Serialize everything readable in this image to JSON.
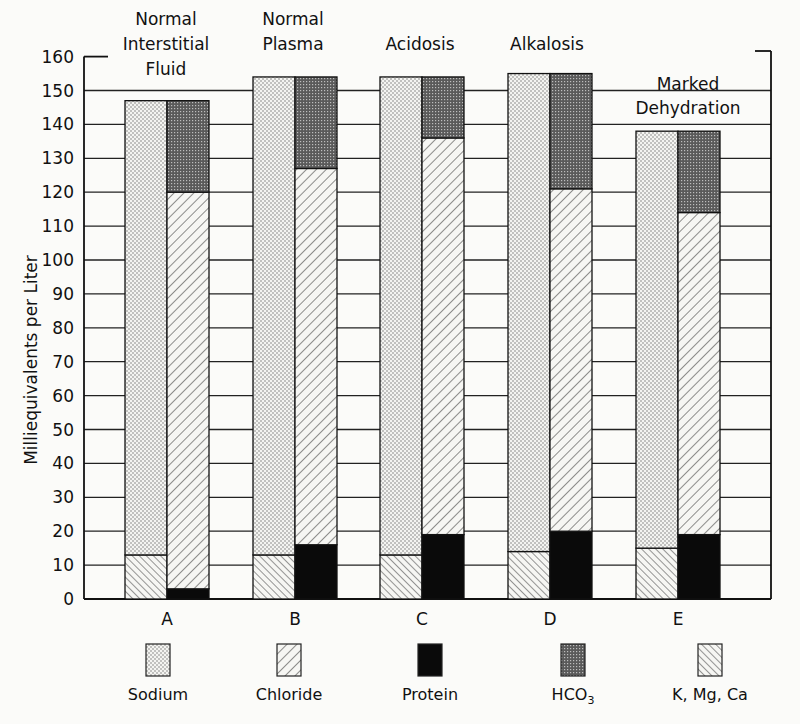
{
  "chart_data": {
    "type": "bar",
    "stacked": true,
    "title": "",
    "ylabel": "Milliequivalents per Liter",
    "xlabel": "",
    "ylim": [
      0,
      160
    ],
    "yticks": [
      0,
      10,
      20,
      30,
      40,
      50,
      60,
      70,
      80,
      90,
      100,
      110,
      120,
      130,
      140,
      150,
      160
    ],
    "grid": "horizontal",
    "categories": [
      "A",
      "B",
      "C",
      "D",
      "E"
    ],
    "category_titles": [
      [
        "Normal",
        "Interstitial",
        "Fluid"
      ],
      [
        "Normal",
        "Plasma"
      ],
      [
        "Acidosis"
      ],
      [
        "Alkalosis"
      ],
      [
        "Marked",
        "Dehydration"
      ]
    ],
    "bars_per_category": [
      "Cations",
      "Anions"
    ],
    "series": [
      {
        "name": "K, Mg, Ca",
        "stack": "Cations",
        "pattern": "back-hatch",
        "values": [
          13,
          13,
          13,
          14,
          15
        ]
      },
      {
        "name": "Sodium",
        "stack": "Cations",
        "pattern": "dots",
        "values": [
          134,
          141,
          141,
          141,
          123
        ]
      },
      {
        "name": "Protein",
        "stack": "Anions",
        "pattern": "solid-black",
        "values": [
          3,
          16,
          19,
          20,
          19
        ]
      },
      {
        "name": "Chloride",
        "stack": "Anions",
        "pattern": "forward-hatch",
        "values": [
          117,
          111,
          117,
          101,
          95
        ]
      },
      {
        "name": "HCO3",
        "stack": "Anions",
        "pattern": "dark-crosshatch",
        "values": [
          27,
          27,
          18,
          34,
          24
        ]
      }
    ],
    "totals": [
      147,
      154,
      154,
      155,
      138
    ],
    "legend": [
      "Sodium",
      "Chloride",
      "Protein",
      "HCO3",
      "K, Mg, Ca"
    ],
    "legend_position": "bottom"
  },
  "axis": {
    "ylabel": "Milliequivalents per Liter",
    "ticks": [
      "0",
      "10",
      "20",
      "30",
      "40",
      "50",
      "60",
      "70",
      "80",
      "90",
      "100",
      "110",
      "120",
      "130",
      "140",
      "150",
      "160"
    ]
  },
  "categories": [
    {
      "label": "A",
      "title": [
        "Normal",
        "Interstitial",
        "Fluid"
      ]
    },
    {
      "label": "B",
      "title": [
        "Normal",
        "Plasma"
      ]
    },
    {
      "label": "C",
      "title": [
        "Acidosis"
      ]
    },
    {
      "label": "D",
      "title": [
        "Alkalosis"
      ]
    },
    {
      "label": "E",
      "title": [
        "Marked",
        "Dehydration"
      ]
    }
  ],
  "legend": [
    {
      "label": "Sodium"
    },
    {
      "label": "Chloride"
    },
    {
      "label": "Protein"
    },
    {
      "label": "HCO",
      "sub": "3"
    },
    {
      "label": "K, Mg, Ca"
    }
  ]
}
